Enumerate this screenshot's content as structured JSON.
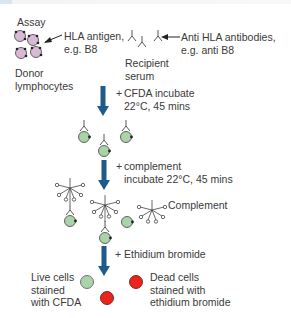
{
  "title": "Assay",
  "labels": {
    "hla_antigen": "HLA antigen,\ne.g. B8",
    "anti_hla": "Anti HLA antibodies,\ne.g. anti B8",
    "recipient_serum": "Recipient\nserum",
    "donor_lymphocytes": "Donor\nlymphocytes",
    "complement": "Complement",
    "live_cells": "Live cells\nstained\nwith CFDA",
    "dead_cells": "Dead cells\nstained with\nethidium bromide"
  },
  "steps": [
    {
      "prefix": "+",
      "text": "CFDA incubate\n22°C, 45 mins"
    },
    {
      "prefix": "+",
      "text": "complement\nincubate 22°C, 45 mins"
    },
    {
      "prefix": "+",
      "text": "Ethidium bromide"
    }
  ],
  "colors": {
    "arrow": "#1f5b8a",
    "donor_cell": "#d9b8d6",
    "live_cell": "#a9d3a9",
    "dead_cell": "#e8241c",
    "line": "#444444"
  }
}
